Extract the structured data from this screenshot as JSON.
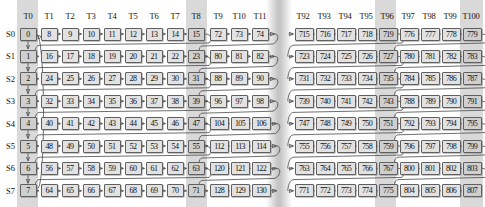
{
  "diagram": {
    "colors": {
      "cell_fill": "#e2e2e2",
      "cell_fill_highlight": "#cfcfcf",
      "band_highlight": "#d9d9d9",
      "border": "#606060",
      "wire": "#4a4a4a",
      "text": "#111111",
      "background": "#ffffff"
    },
    "row_labels": [
      "S0",
      "S1",
      "S2",
      "S3",
      "S4",
      "S5",
      "S6",
      "S7"
    ],
    "column_headers": {
      "t0": [
        "T0"
      ],
      "segment_a": [
        "T1",
        "T2",
        "T3",
        "T4",
        "T5",
        "T6",
        "T7",
        "T8"
      ],
      "segment_b": [
        "T9",
        "T10",
        "T11"
      ],
      "segment_c": [
        "T92",
        "T93",
        "T94",
        "T95",
        "T96"
      ],
      "segment_d": [
        "T97",
        "T98",
        "T99",
        "T100"
      ]
    },
    "highlighted_columns": [
      "T0",
      "T8",
      "T96",
      "T100"
    ],
    "elision_gap": true,
    "segments": {
      "t0": {
        "rows": [
          [
            "0"
          ],
          [
            "1"
          ],
          [
            "2"
          ],
          [
            "3"
          ],
          [
            "4"
          ],
          [
            "5"
          ],
          [
            "6"
          ],
          [
            "7"
          ]
        ]
      },
      "segment_a": {
        "rows": [
          [
            "8",
            "9",
            "10",
            "11",
            "12",
            "13",
            "14",
            "15"
          ],
          [
            "16",
            "17",
            "18",
            "19",
            "20",
            "21",
            "22",
            "23"
          ],
          [
            "24",
            "25",
            "26",
            "27",
            "28",
            "29",
            "30",
            "31"
          ],
          [
            "32",
            "33",
            "34",
            "35",
            "36",
            "37",
            "38",
            "39"
          ],
          [
            "40",
            "41",
            "42",
            "43",
            "44",
            "45",
            "46",
            "47"
          ],
          [
            "48",
            "49",
            "50",
            "51",
            "52",
            "53",
            "54",
            "55"
          ],
          [
            "56",
            "57",
            "58",
            "59",
            "60",
            "61",
            "62",
            "63"
          ],
          [
            "64",
            "65",
            "66",
            "67",
            "68",
            "69",
            "70",
            "71"
          ]
        ]
      },
      "segment_b": {
        "rows": [
          [
            "72",
            "73",
            "74"
          ],
          [
            "80",
            "81",
            "82"
          ],
          [
            "88",
            "89",
            "90"
          ],
          [
            "96",
            "97",
            "98"
          ],
          [
            "104",
            "105",
            "106"
          ],
          [
            "112",
            "113",
            "114"
          ],
          [
            "120",
            "121",
            "122"
          ],
          [
            "128",
            "129",
            "130"
          ]
        ]
      },
      "segment_c": {
        "rows": [
          [
            "715",
            "716",
            "717",
            "718",
            "719"
          ],
          [
            "723",
            "724",
            "725",
            "726",
            "727"
          ],
          [
            "731",
            "732",
            "733",
            "734",
            "735"
          ],
          [
            "739",
            "740",
            "741",
            "742",
            "743"
          ],
          [
            "747",
            "748",
            "749",
            "750",
            "751"
          ],
          [
            "755",
            "756",
            "757",
            "758",
            "759"
          ],
          [
            "763",
            "764",
            "765",
            "766",
            "767"
          ],
          [
            "771",
            "772",
            "773",
            "774",
            "775"
          ]
        ]
      },
      "segment_d": {
        "rows": [
          [
            "776",
            "777",
            "778",
            "779"
          ],
          [
            "780",
            "781",
            "782",
            "783"
          ],
          [
            "784",
            "785",
            "786",
            "787"
          ],
          [
            "788",
            "789",
            "790",
            "791"
          ],
          [
            "792",
            "793",
            "794",
            "795"
          ],
          [
            "796",
            "797",
            "798",
            "799"
          ],
          [
            "800",
            "801",
            "802",
            "803"
          ],
          [
            "804",
            "805",
            "806",
            "807"
          ]
        ]
      }
    }
  }
}
